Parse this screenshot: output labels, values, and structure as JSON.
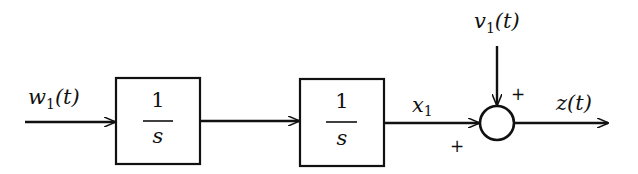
{
  "diagram": {
    "type": "block-diagram",
    "input": {
      "label": "w",
      "subscript": "1",
      "suffix": "(t)"
    },
    "blocks": [
      {
        "id": "integrator-1",
        "numerator": "1",
        "denominator": "s"
      },
      {
        "id": "integrator-2",
        "numerator": "1",
        "denominator": "s"
      }
    ],
    "intermediate": {
      "label": "x",
      "subscript": "1"
    },
    "disturbance": {
      "label": "v",
      "subscript": "1",
      "suffix": "(t)"
    },
    "summing_junction": {
      "sign_left": "+",
      "sign_top": "+"
    },
    "output": {
      "label": "z(t)"
    },
    "colors": {
      "stroke": "#111111",
      "background": "#ffffff"
    }
  }
}
